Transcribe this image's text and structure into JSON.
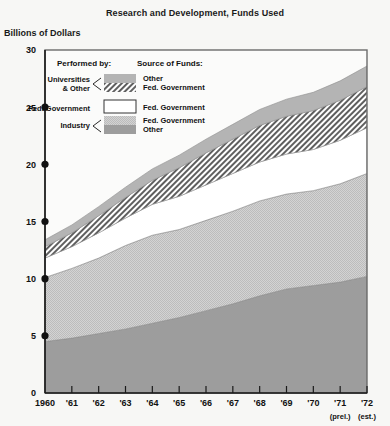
{
  "chart_data": {
    "type": "area",
    "title": "Research and Development, Funds Used",
    "ylabel": "Billions of Dollars",
    "xlabel": "",
    "ylim": [
      0,
      30
    ],
    "ytick_values": [
      0,
      5,
      10,
      15,
      20,
      25,
      30
    ],
    "ytick_labels": [
      "0",
      "5",
      "10",
      "15",
      "20",
      "25",
      "30"
    ],
    "grid": false,
    "legend_position": "inside-top-left",
    "stacked": true,
    "x": [
      1960,
      1961,
      1962,
      1963,
      1964,
      1965,
      1966,
      1967,
      1968,
      1969,
      1970,
      1971,
      1972
    ],
    "xtick_labels": [
      "1960",
      "'61",
      "'62",
      "'63",
      "'64",
      "'65",
      "'66",
      "'67",
      "'68",
      "'69",
      "'70",
      "'71",
      "'72"
    ],
    "xtick_notes": [
      "",
      "",
      "",
      "",
      "",
      "",
      "",
      "",
      "",
      "",
      "",
      "(prel.)",
      "(est.)"
    ],
    "series": [
      {
        "name": "Industry / Other",
        "performed_by": "Industry",
        "source_of_funds": "Other",
        "fill": "solid-dark-gray",
        "color": "#9a9a9a",
        "values": [
          4.5,
          4.8,
          5.2,
          5.6,
          6.1,
          6.6,
          7.2,
          7.8,
          8.5,
          9.1,
          9.4,
          9.7,
          10.2
        ]
      },
      {
        "name": "Industry / Fed. Government",
        "performed_by": "Industry",
        "source_of_funds": "Fed. Government",
        "fill": "stipple-light-gray",
        "color": "#c9c9c9",
        "values": [
          5.6,
          6.1,
          6.6,
          7.3,
          7.7,
          7.7,
          7.9,
          8.1,
          8.3,
          8.3,
          8.3,
          8.6,
          9.0
        ]
      },
      {
        "name": "Fed. Government (intramural)",
        "performed_by": "Fed. Government",
        "source_of_funds": "Fed. Government",
        "fill": "white",
        "color": "#ffffff",
        "values": [
          1.7,
          1.9,
          2.2,
          2.4,
          2.7,
          2.9,
          3.1,
          3.3,
          3.4,
          3.5,
          3.6,
          3.8,
          4.0
        ]
      },
      {
        "name": "Universities & Other / Fed. Government",
        "performed_by": "Universities & Other",
        "source_of_funds": "Fed. Government",
        "fill": "diagonal-hatch",
        "color": "#6e6e6e",
        "values": [
          1.0,
          1.2,
          1.5,
          1.8,
          2.1,
          2.5,
          2.8,
          3.0,
          3.2,
          3.3,
          3.4,
          3.5,
          3.6
        ]
      },
      {
        "name": "Universities & Other / Other",
        "performed_by": "Universities & Other",
        "source_of_funds": "Other",
        "fill": "solid-medium-gray",
        "color": "#b0b0b0",
        "values": [
          0.6,
          0.7,
          0.8,
          0.9,
          1.0,
          1.1,
          1.2,
          1.3,
          1.4,
          1.5,
          1.6,
          1.7,
          1.8
        ]
      }
    ]
  },
  "legend": {
    "performed_by_header": "Performed by:",
    "source_of_funds_header": "Source of Funds:",
    "rows": [
      {
        "performed_by_line1": "Universities",
        "performed_by_line2": "& Other",
        "source_line1": "Other",
        "source_line2": "Fed. Government",
        "swatch": "split-gray-over-hatch"
      },
      {
        "performed_by_line1": "Fed. Government",
        "performed_by_line2": "",
        "source_line1": "Fed. Government",
        "source_line2": "",
        "swatch": "white-box"
      },
      {
        "performed_by_line1": "Industry",
        "performed_by_line2": "",
        "source_line1": "Fed. Government",
        "source_line2": "Other",
        "swatch": "split-lightgray-over-darkgray"
      }
    ]
  },
  "colors": {
    "background": "#f7f7f5",
    "plot_background": "#fbfbfa",
    "frame": "#555555",
    "axis": "#1a1a1a",
    "dark_gray": "#9a9a9a",
    "light_gray": "#c9c9c9",
    "medium_gray": "#b0b0b0",
    "hatch": "#6e6e6e",
    "white": "#ffffff"
  }
}
